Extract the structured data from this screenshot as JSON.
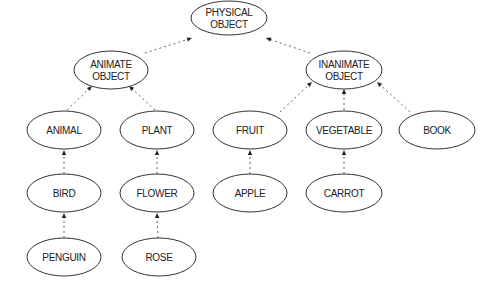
{
  "diagram": {
    "type": "hierarchy",
    "nodes": [
      {
        "id": "physical_object",
        "lines": [
          "PHYSICAL",
          "OBJECT"
        ],
        "cx": 229,
        "cy": 18,
        "rx": 38,
        "ry": 17
      },
      {
        "id": "animate_object",
        "lines": [
          "ANIMATE",
          "OBJECT"
        ],
        "cx": 111,
        "cy": 70,
        "rx": 37,
        "ry": 19
      },
      {
        "id": "inanimate_object",
        "lines": [
          "INANIMATE",
          "OBJECT"
        ],
        "cx": 344,
        "cy": 70,
        "rx": 38,
        "ry": 19
      },
      {
        "id": "animal",
        "lines": [
          "ANIMAL"
        ],
        "cx": 64,
        "cy": 130,
        "rx": 37,
        "ry": 19
      },
      {
        "id": "plant",
        "lines": [
          "PLANT"
        ],
        "cx": 157,
        "cy": 130,
        "rx": 37,
        "ry": 19
      },
      {
        "id": "fruit",
        "lines": [
          "FRUIT"
        ],
        "cx": 250,
        "cy": 130,
        "rx": 37,
        "ry": 19
      },
      {
        "id": "vegetable",
        "lines": [
          "VEGETABLE"
        ],
        "cx": 344,
        "cy": 130,
        "rx": 38,
        "ry": 19
      },
      {
        "id": "book",
        "lines": [
          "BOOK"
        ],
        "cx": 437,
        "cy": 130,
        "rx": 38,
        "ry": 19
      },
      {
        "id": "bird",
        "lines": [
          "BIRD"
        ],
        "cx": 64,
        "cy": 193,
        "rx": 37,
        "ry": 19
      },
      {
        "id": "flower",
        "lines": [
          "FLOWER"
        ],
        "cx": 157,
        "cy": 193,
        "rx": 37,
        "ry": 19
      },
      {
        "id": "apple",
        "lines": [
          "APPLE"
        ],
        "cx": 250,
        "cy": 193,
        "rx": 37,
        "ry": 19
      },
      {
        "id": "carrot",
        "lines": [
          "CARROT"
        ],
        "cx": 344,
        "cy": 193,
        "rx": 38,
        "ry": 19
      },
      {
        "id": "penguin",
        "lines": [
          "PENGUIN"
        ],
        "cx": 64,
        "cy": 257,
        "rx": 37,
        "ry": 19
      },
      {
        "id": "rose",
        "lines": [
          "ROSE"
        ],
        "cx": 159,
        "cy": 257,
        "rx": 37,
        "ry": 19
      }
    ],
    "edges": [
      {
        "from": "animate_object",
        "to": "physical_object",
        "x1": 145,
        "y1": 53,
        "x2": 192,
        "y2": 38
      },
      {
        "from": "inanimate_object",
        "to": "physical_object",
        "x1": 310,
        "y1": 53,
        "x2": 266,
        "y2": 38
      },
      {
        "from": "animal",
        "to": "animate_object",
        "x1": 67,
        "y1": 110,
        "x2": 92,
        "y2": 86
      },
      {
        "from": "plant",
        "to": "animate_object",
        "x1": 155,
        "y1": 110,
        "x2": 129,
        "y2": 86
      },
      {
        "from": "fruit",
        "to": "inanimate_object",
        "x1": 280,
        "y1": 112,
        "x2": 312,
        "y2": 82
      },
      {
        "from": "vegetable",
        "to": "inanimate_object",
        "x1": 344,
        "y1": 110,
        "x2": 344,
        "y2": 89
      },
      {
        "from": "book",
        "to": "inanimate_object",
        "x1": 410,
        "y1": 112,
        "x2": 377,
        "y2": 82
      },
      {
        "from": "bird",
        "to": "animal",
        "x1": 64,
        "y1": 174,
        "x2": 64,
        "y2": 150
      },
      {
        "from": "flower",
        "to": "plant",
        "x1": 157,
        "y1": 174,
        "x2": 157,
        "y2": 150
      },
      {
        "from": "apple",
        "to": "fruit",
        "x1": 250,
        "y1": 174,
        "x2": 250,
        "y2": 150
      },
      {
        "from": "carrot",
        "to": "vegetable",
        "x1": 344,
        "y1": 174,
        "x2": 344,
        "y2": 150
      },
      {
        "from": "penguin",
        "to": "bird",
        "x1": 64,
        "y1": 238,
        "x2": 64,
        "y2": 213
      },
      {
        "from": "rose",
        "to": "flower",
        "x1": 158,
        "y1": 238,
        "x2": 157,
        "y2": 213
      }
    ]
  }
}
